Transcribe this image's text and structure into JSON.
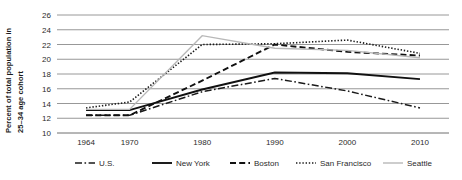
{
  "chart_data": {
    "type": "line",
    "title": "",
    "xlabel": "",
    "ylabel": "Percent of total population in 25–34 age cohort",
    "ylabel_line1": "Percent of total population in",
    "ylabel_line2": "25–34 age cohort",
    "x": [
      1964,
      1970,
      1980,
      1990,
      2000,
      2010
    ],
    "categories": [
      "1964",
      "1970",
      "1980",
      "1990",
      "2000",
      "2010"
    ],
    "xlim": [
      1960,
      2014
    ],
    "ylim": [
      10,
      26
    ],
    "yticks": [
      10,
      12,
      14,
      16,
      18,
      20,
      22,
      24,
      26
    ],
    "ytick_labels": [
      "10",
      "12",
      "14",
      "16",
      "18",
      "20",
      "22",
      "24",
      "26"
    ],
    "grid": true,
    "legend_position": "bottom",
    "series": [
      {
        "name": "U.S.",
        "style": "dashdot",
        "color": "#1a1a1a",
        "width": 1.5,
        "dasharray": "7,2.5,1.6,2.5",
        "values": [
          12.4,
          12.4,
          15.6,
          17.4,
          15.7,
          13.4
        ]
      },
      {
        "name": "New York",
        "style": "solid",
        "color": "#111111",
        "width": 1.9,
        "dasharray": "",
        "values": [
          13.1,
          13.1,
          15.9,
          18.2,
          18.1,
          17.3
        ]
      },
      {
        "name": "Boston",
        "style": "dashed",
        "color": "#111111",
        "width": 1.9,
        "dasharray": "6,3.2",
        "values": [
          12.4,
          12.4,
          17.1,
          22.0,
          21.0,
          20.5
        ]
      },
      {
        "name": "San Francisco",
        "style": "dotted",
        "color": "#1a1a1a",
        "width": 1.6,
        "dasharray": "1.4,1.8",
        "values": [
          13.4,
          14.2,
          22.0,
          22.1,
          22.6,
          20.8
        ]
      },
      {
        "name": "Seattle",
        "style": "solid",
        "color": "#b8b8b8",
        "width": 1.4,
        "dasharray": "",
        "values": [
          13.2,
          13.2,
          23.2,
          21.5,
          21.2,
          20.2
        ]
      }
    ]
  },
  "legend": {
    "items": [
      {
        "label": "U.S."
      },
      {
        "label": "New York"
      },
      {
        "label": "Boston"
      },
      {
        "label": "San Francisco"
      },
      {
        "label": "Seattle"
      }
    ]
  }
}
